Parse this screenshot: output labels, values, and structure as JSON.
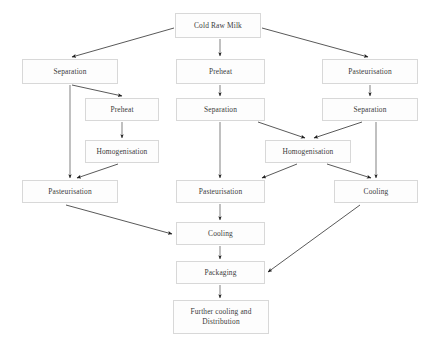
{
  "diagram": {
    "type": "flowchart",
    "colors": {
      "box_border": "#d8d8d8",
      "box_fill": "#fdfdfd",
      "text": "#3b3b3b",
      "arrow": "#2e2e2e",
      "background": "#ffffff"
    },
    "nodes": [
      {
        "id": "cold-raw-milk",
        "label": "Cold Raw Milk",
        "x": 175,
        "y": 13,
        "w": 86,
        "h": 25
      },
      {
        "id": "separation-left",
        "label": "Separation",
        "x": 22,
        "y": 59,
        "w": 96,
        "h": 25
      },
      {
        "id": "preheat-center-top",
        "label": "Preheat",
        "x": 176,
        "y": 59,
        "w": 89,
        "h": 25
      },
      {
        "id": "pasteurisation-right",
        "label": "Pasteurisation",
        "x": 322,
        "y": 59,
        "w": 96,
        "h": 25
      },
      {
        "id": "preheat-left",
        "label": "Preheat",
        "x": 85,
        "y": 98,
        "w": 74,
        "h": 23
      },
      {
        "id": "separation-center",
        "label": "Separation",
        "x": 176,
        "y": 98,
        "w": 89,
        "h": 23
      },
      {
        "id": "separation-right",
        "label": "Separation",
        "x": 322,
        "y": 98,
        "w": 96,
        "h": 23
      },
      {
        "id": "homogenisation-left",
        "label": "Homogenisation",
        "x": 85,
        "y": 140,
        "w": 74,
        "h": 23
      },
      {
        "id": "homogenisation-right",
        "label": "Homogenisation",
        "x": 265,
        "y": 140,
        "w": 86,
        "h": 23
      },
      {
        "id": "pasteurisation-left",
        "label": "Pasteurisation",
        "x": 22,
        "y": 180,
        "w": 96,
        "h": 23
      },
      {
        "id": "pasteurisation-center",
        "label": "Pasteurisation",
        "x": 176,
        "y": 180,
        "w": 89,
        "h": 23
      },
      {
        "id": "cooling-right",
        "label": "Cooling",
        "x": 334,
        "y": 180,
        "w": 84,
        "h": 23
      },
      {
        "id": "cooling-center",
        "label": "Cooling",
        "x": 176,
        "y": 222,
        "w": 89,
        "h": 23
      },
      {
        "id": "packaging",
        "label": "Packaging",
        "x": 176,
        "y": 261,
        "w": 89,
        "h": 23
      },
      {
        "id": "further-cooling",
        "label": "Further cooling and\nDistribution",
        "x": 173,
        "y": 300,
        "w": 96,
        "h": 34
      }
    ],
    "edges": [
      {
        "from": "cold-raw-milk",
        "to": "separation-left",
        "kind": "diagonal"
      },
      {
        "from": "cold-raw-milk",
        "to": "preheat-center-top",
        "kind": "vertical"
      },
      {
        "from": "cold-raw-milk",
        "to": "pasteurisation-right",
        "kind": "diagonal"
      },
      {
        "from": "separation-left",
        "to": "preheat-left",
        "kind": "diagonal"
      },
      {
        "from": "separation-left",
        "to": "pasteurisation-left",
        "kind": "vertical"
      },
      {
        "from": "preheat-center-top",
        "to": "separation-center",
        "kind": "vertical"
      },
      {
        "from": "pasteurisation-right",
        "to": "separation-right",
        "kind": "vertical"
      },
      {
        "from": "preheat-left",
        "to": "homogenisation-left",
        "kind": "vertical"
      },
      {
        "from": "separation-center",
        "to": "homogenisation-right",
        "kind": "diagonal"
      },
      {
        "from": "separation-right",
        "to": "homogenisation-right",
        "kind": "diagonal"
      },
      {
        "from": "homogenisation-left",
        "to": "pasteurisation-left",
        "kind": "diagonal"
      },
      {
        "from": "separation-center",
        "to": "pasteurisation-center",
        "kind": "vertical"
      },
      {
        "from": "homogenisation-right",
        "to": "pasteurisation-center",
        "kind": "diagonal"
      },
      {
        "from": "homogenisation-right",
        "to": "cooling-right",
        "kind": "diagonal"
      },
      {
        "from": "separation-right",
        "to": "cooling-right",
        "kind": "vertical"
      },
      {
        "from": "pasteurisation-left",
        "to": "cooling-center",
        "kind": "diagonal"
      },
      {
        "from": "pasteurisation-center",
        "to": "cooling-center",
        "kind": "vertical"
      },
      {
        "from": "cooling-center",
        "to": "packaging",
        "kind": "vertical"
      },
      {
        "from": "cooling-right",
        "to": "packaging",
        "kind": "diagonal"
      },
      {
        "from": "packaging",
        "to": "further-cooling",
        "kind": "vertical"
      }
    ]
  }
}
